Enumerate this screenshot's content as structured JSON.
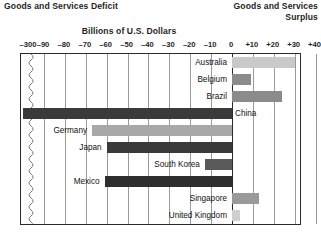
{
  "header": {
    "left_title": "Goods and Services Deficit",
    "right_title_line1": "Goods and Services",
    "right_title_line2": "Surplus"
  },
  "chart_data": {
    "type": "bar",
    "orientation": "horizontal",
    "title": "Billions of U.S. Dollars",
    "xlabel": "Billions of U.S. Dollars",
    "ylabel": "",
    "grid": true,
    "legend": false,
    "axis_break": true,
    "axis_break_note": "Axis broken between -300 and -90",
    "xlim": [
      -300,
      40
    ],
    "tick_labels": [
      "–300",
      "–90",
      "–80",
      "–70",
      "–60",
      "–50",
      "–40",
      "–30",
      "–20",
      "–10",
      "0",
      "+10",
      "+20",
      "+30",
      "+40"
    ],
    "tick_values": [
      -300,
      -90,
      -80,
      -70,
      -60,
      -50,
      -40,
      -30,
      -20,
      -10,
      0,
      10,
      20,
      30,
      40
    ],
    "categories": [
      "Australia",
      "Belgium",
      "Brazil",
      "China",
      "Germany",
      "Japan",
      "South Korea",
      "Mexico",
      "Singapore",
      "United Kingdom"
    ],
    "values": [
      30,
      9,
      24,
      -300,
      -67,
      -60,
      -13,
      -61,
      13,
      4
    ],
    "colors": [
      "#c9c9c9",
      "#8b8b8b",
      "#8b8b8b",
      "#3a3a3a",
      "#a8a8a8",
      "#3a3a3a",
      "#5a5a5a",
      "#2e2e2e",
      "#9a9a9a",
      "#cfcfcf"
    ],
    "label_sides": [
      "inside-left",
      "inside-left",
      "inside-left",
      "outside-right",
      "outside-left",
      "outside-left",
      "inside-left",
      "outside-left",
      "inside-left",
      "inside-left"
    ]
  }
}
